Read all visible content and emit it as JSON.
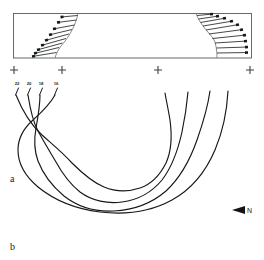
{
  "figure": {
    "width": 264,
    "height": 260,
    "background": "#ffffff",
    "ink_color": "#171717",
    "frame_color": "#555c60"
  },
  "panels": [
    {
      "id": "a",
      "label": "a",
      "label_x": 10,
      "label_y": 182,
      "type": "cross-section",
      "description": "Profile box with hachured scarp faces at left and right ends"
    },
    {
      "id": "b",
      "label": "b",
      "label_x": 10,
      "label_y": 250,
      "type": "contour-map",
      "description": "Nested U-shaped contour lines opening upward"
    }
  ],
  "cross_section": {
    "frame": {
      "x": 13,
      "y": 13,
      "width": 239,
      "height": 45
    },
    "station_markers": [
      {
        "name": "station-1",
        "x": 14,
        "y": 70
      },
      {
        "name": "station-2",
        "x": 62,
        "y": 70
      },
      {
        "name": "station-3",
        "x": 158,
        "y": 70
      },
      {
        "name": "station-4",
        "x": 250,
        "y": 70
      }
    ],
    "marker_symbol": "+",
    "hachure_count_left": 9,
    "hachure_count_right": 10
  },
  "contour_map": {
    "labels": [
      {
        "value": "22",
        "x": 17,
        "y": 85
      },
      {
        "value": "20",
        "x": 29,
        "y": 85
      },
      {
        "value": "18",
        "x": 41,
        "y": 85
      },
      {
        "value": "16",
        "x": 56,
        "y": 85
      }
    ],
    "contour_interval": "2",
    "line_count": 4,
    "orientation_marker": {
      "label": "N",
      "symbol": "left-triangle",
      "x": 232,
      "y": 210
    }
  }
}
